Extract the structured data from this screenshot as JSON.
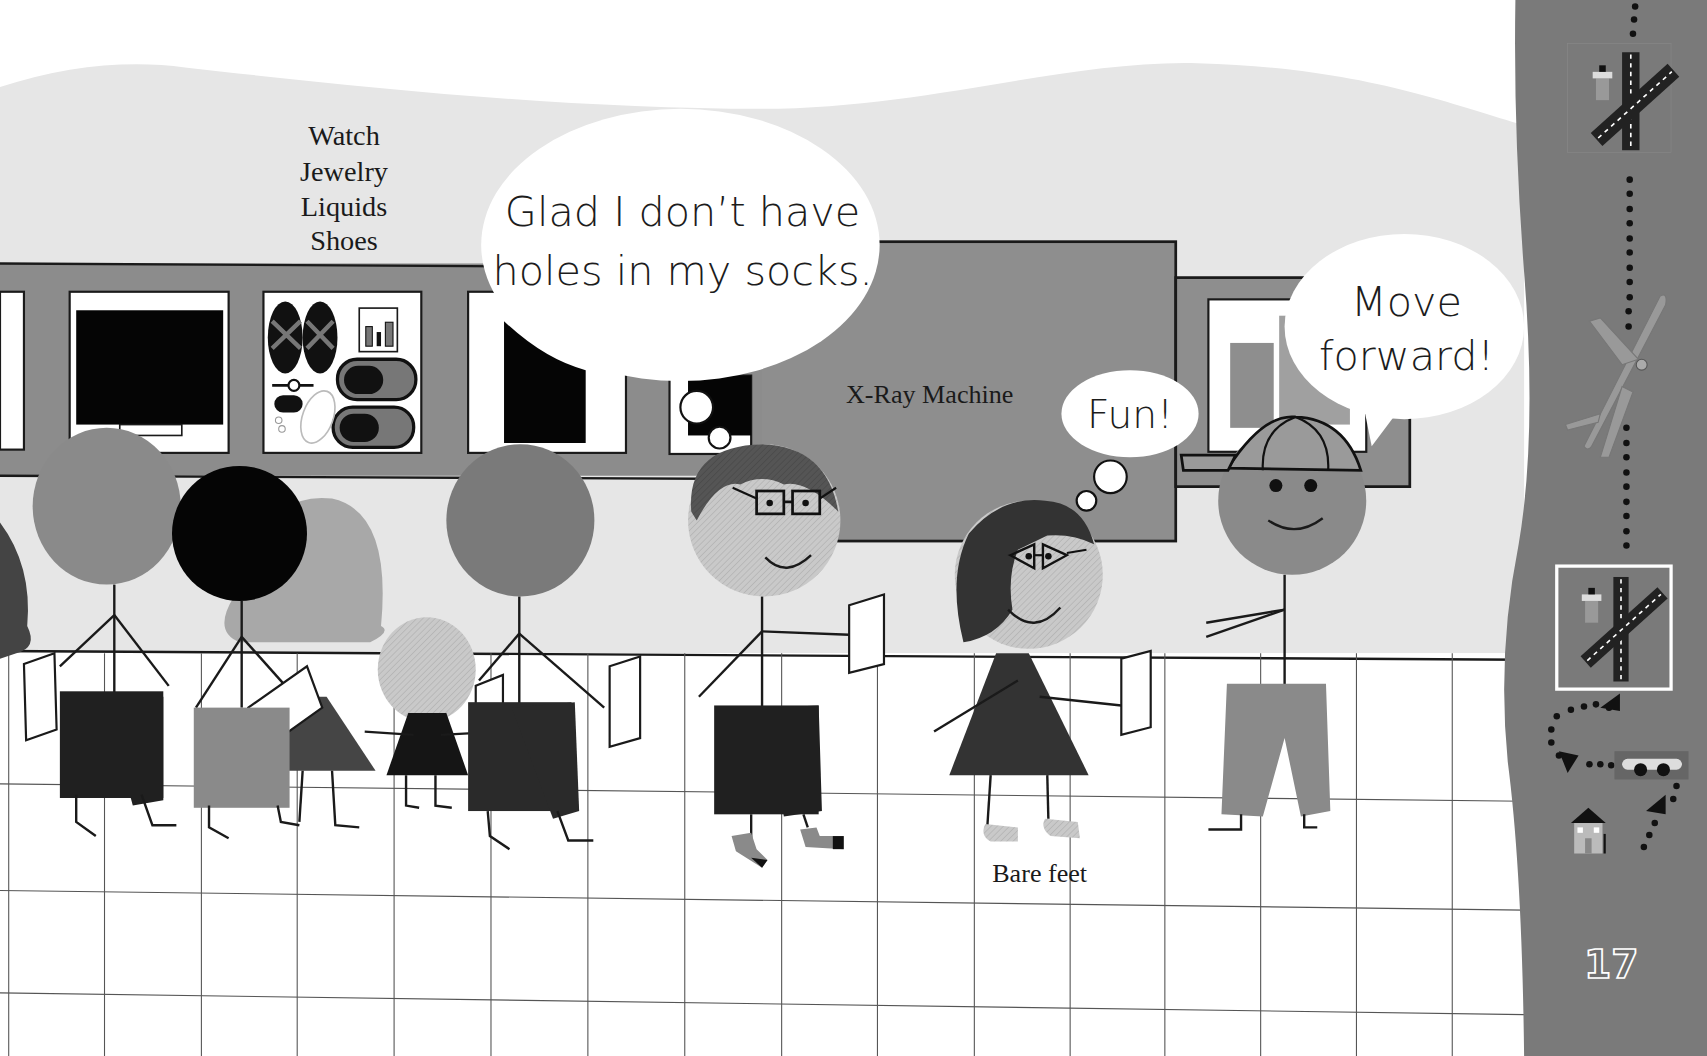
{
  "page": {
    "number": "17",
    "colors": {
      "wall": "#e6e6e6",
      "sky": "#ffffff",
      "conveyor": "#8c8c8c",
      "xray": "#8e8e8e",
      "sidebar": "#7a7a7a",
      "floor": "#ffffff",
      "ink": "#1a1a1a"
    }
  },
  "labels": {
    "tray_items": [
      "Watch",
      "Jewelry",
      "Liquids",
      "Shoes"
    ],
    "xray_machine": "X-Ray Machine",
    "bare_feet": "Bare feet"
  },
  "speech": {
    "glasses_boy": [
      "Glad I don’t have",
      "holes in my socks."
    ],
    "girl_thought": "Fun!",
    "cap_boy": [
      "Move",
      "forward!"
    ]
  },
  "sidebar": {
    "journey_icons": [
      {
        "name": "airport-runway-icon",
        "label": "airport"
      },
      {
        "name": "airplane-icon",
        "label": "airplane"
      },
      {
        "name": "airport-runway-highlight-icon",
        "label": "airport (current)"
      },
      {
        "name": "car-icon",
        "label": "car"
      },
      {
        "name": "house-icon",
        "label": "home"
      }
    ]
  }
}
